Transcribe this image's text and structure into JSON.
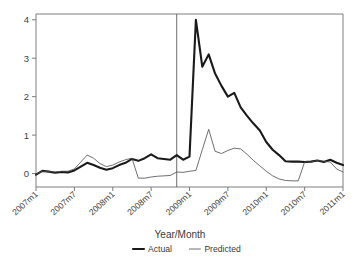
{
  "chart_data": {
    "type": "line",
    "title": "",
    "xlabel": "Year/Month",
    "ylabel": "",
    "ylim": [
      -0.35,
      4.15
    ],
    "yticks": [
      0,
      1,
      2,
      3,
      4
    ],
    "ytick_labels": [
      "0",
      "1",
      "2",
      "3",
      "4"
    ],
    "xtick_labels": [
      "2007m1",
      "2007m7",
      "2008m1",
      "2008m7",
      "2009m1",
      "2009m7",
      "2010m1",
      "2010m7",
      "2011m1"
    ],
    "xtick_indices": [
      0,
      6,
      12,
      18,
      24,
      30,
      36,
      42,
      48
    ],
    "grid": false,
    "legend_position": "bottom",
    "annotations": [
      {
        "type": "vertical-line",
        "x_index": 22,
        "label": ""
      }
    ],
    "x": [
      "2007m1",
      "2007m2",
      "2007m3",
      "2007m4",
      "2007m5",
      "2007m6",
      "2007m7",
      "2007m8",
      "2007m9",
      "2007m10",
      "2007m11",
      "2007m12",
      "2008m1",
      "2008m2",
      "2008m3",
      "2008m4",
      "2008m5",
      "2008m6",
      "2008m7",
      "2008m8",
      "2008m9",
      "2008m10",
      "2008m11",
      "2008m12",
      "2009m1",
      "2009m2",
      "2009m3",
      "2009m4",
      "2009m5",
      "2009m6",
      "2009m7",
      "2009m8",
      "2009m9",
      "2009m10",
      "2009m11",
      "2009m12",
      "2010m1",
      "2010m2",
      "2010m3",
      "2010m4",
      "2010m5",
      "2010m6",
      "2010m7",
      "2010m8",
      "2010m9",
      "2010m10",
      "2010m11",
      "2010m12",
      "2011m1"
    ],
    "series": [
      {
        "name": "Actual",
        "style": "thick",
        "values": [
          -0.03,
          0.07,
          0.05,
          0.02,
          0.04,
          0.03,
          0.08,
          0.18,
          0.28,
          0.22,
          0.15,
          0.1,
          0.14,
          0.22,
          0.28,
          0.38,
          0.33,
          0.4,
          0.5,
          0.4,
          0.38,
          0.36,
          0.48,
          0.36,
          0.44,
          4.0,
          2.78,
          3.1,
          2.6,
          2.28,
          2.0,
          2.1,
          1.72,
          1.5,
          1.3,
          1.12,
          0.82,
          0.62,
          0.48,
          0.32,
          0.31,
          0.31,
          0.3,
          0.31,
          0.34,
          0.3,
          0.36,
          0.28,
          0.22
        ]
      },
      {
        "name": "Predicted",
        "style": "thin",
        "values": [
          -0.02,
          0.06,
          0.05,
          0.04,
          0.06,
          0.06,
          0.12,
          0.3,
          0.48,
          0.4,
          0.26,
          0.18,
          0.22,
          0.3,
          0.36,
          0.4,
          -0.12,
          -0.12,
          -0.09,
          -0.07,
          -0.06,
          -0.05,
          0.04,
          0.03,
          0.06,
          0.08,
          0.62,
          1.15,
          0.58,
          0.52,
          0.6,
          0.66,
          0.64,
          0.5,
          0.34,
          0.2,
          0.06,
          -0.06,
          -0.14,
          -0.18,
          -0.19,
          -0.19,
          0.3,
          0.3,
          0.34,
          0.32,
          0.3,
          0.12,
          0.04
        ]
      }
    ]
  },
  "legend": {
    "items": [
      {
        "label": "Actual",
        "style": "thick"
      },
      {
        "label": "Predicted",
        "style": "thin"
      }
    ]
  }
}
